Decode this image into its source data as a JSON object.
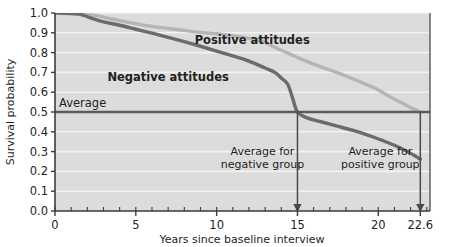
{
  "chart_data": {
    "type": "line",
    "title": "",
    "xlabel": "Years since baseline interview",
    "ylabel": "Survival probability",
    "xlim": [
      0,
      23.2
    ],
    "ylim": [
      0.0,
      1.0
    ],
    "grid": "horizontal",
    "legend": "inline-annotations",
    "xticks": [
      0,
      5,
      10,
      15,
      20,
      22.6
    ],
    "xtick_labels": [
      "0",
      "5",
      "10",
      "15",
      "20",
      "22.6"
    ],
    "xminor_step": 1,
    "yticks": [
      0.0,
      0.1,
      0.2,
      0.3,
      0.4,
      0.5,
      0.6,
      0.7,
      0.8,
      0.9,
      1.0
    ],
    "ytick_labels": [
      "0.0",
      "0.1",
      "0.2",
      "0.3",
      "0.4",
      "0.5",
      "0.6",
      "0.7",
      "0.8",
      "0.9",
      "1.0"
    ],
    "series": [
      {
        "name": "Negative attitudes",
        "color": "#6b6b6b",
        "label_x": 7.0,
        "label_y": 0.655,
        "median_survival_years": 15.0,
        "points": [
          [
            0.0,
            1.0
          ],
          [
            1.0,
            0.997
          ],
          [
            1.6,
            0.993
          ],
          [
            2.2,
            0.975
          ],
          [
            3.0,
            0.955
          ],
          [
            4.0,
            0.938
          ],
          [
            5.0,
            0.918
          ],
          [
            6.0,
            0.898
          ],
          [
            7.0,
            0.877
          ],
          [
            8.0,
            0.855
          ],
          [
            9.0,
            0.832
          ],
          [
            10.0,
            0.808
          ],
          [
            11.0,
            0.783
          ],
          [
            12.0,
            0.757
          ],
          [
            13.0,
            0.722
          ],
          [
            13.6,
            0.7
          ],
          [
            14.0,
            0.672
          ],
          [
            14.4,
            0.64
          ],
          [
            14.7,
            0.57
          ],
          [
            15.0,
            0.5
          ],
          [
            15.6,
            0.47
          ],
          [
            16.4,
            0.452
          ],
          [
            17.4,
            0.43
          ],
          [
            18.4,
            0.408
          ],
          [
            19.4,
            0.382
          ],
          [
            20.2,
            0.358
          ],
          [
            21.0,
            0.332
          ],
          [
            21.8,
            0.3
          ],
          [
            22.6,
            0.262
          ]
        ]
      },
      {
        "name": "Positive attitudes",
        "color": "#b5b5b5",
        "label_x": 12.2,
        "label_y": 0.845,
        "median_survival_years": 22.6,
        "points": [
          [
            1.5,
            0.992
          ],
          [
            2.5,
            0.988
          ],
          [
            3.4,
            0.972
          ],
          [
            4.4,
            0.955
          ],
          [
            5.4,
            0.94
          ],
          [
            6.2,
            0.93
          ],
          [
            7.0,
            0.922
          ],
          [
            8.0,
            0.912
          ],
          [
            9.0,
            0.902
          ],
          [
            10.0,
            0.895
          ],
          [
            11.0,
            0.885
          ],
          [
            12.0,
            0.872
          ],
          [
            12.8,
            0.858
          ],
          [
            13.4,
            0.835
          ],
          [
            14.0,
            0.812
          ],
          [
            14.6,
            0.79
          ],
          [
            15.2,
            0.768
          ],
          [
            16.0,
            0.742
          ],
          [
            17.0,
            0.712
          ],
          [
            18.0,
            0.682
          ],
          [
            19.0,
            0.648
          ],
          [
            19.8,
            0.62
          ],
          [
            20.4,
            0.592
          ],
          [
            21.0,
            0.565
          ],
          [
            21.6,
            0.54
          ],
          [
            22.0,
            0.522
          ],
          [
            22.6,
            0.5
          ]
        ]
      }
    ],
    "reference_line": {
      "label": "Average",
      "y": 0.5,
      "color": "#5a5a5a"
    },
    "annotations": [
      {
        "id": "negative-group-annotation",
        "text_line1": "Average for",
        "text_line2": "negative group",
        "arrow_x": 15.0,
        "arrow_from_y": 0.5,
        "arrow_to_y": 0.0
      },
      {
        "id": "positive-group-annotation",
        "text_line1": "Average for",
        "text_line2": "positive group",
        "arrow_x": 22.6,
        "arrow_from_y": 0.5,
        "arrow_to_y": 0.0
      }
    ],
    "colors": {
      "plot_background": "#dcdcdc",
      "gridline": "#f2f2f2",
      "axis": "#3b3b3b",
      "text": "#231f20",
      "negative_series": "#6b6b6b",
      "positive_series": "#b5b5b5",
      "average_line": "#5a5a5a"
    }
  }
}
